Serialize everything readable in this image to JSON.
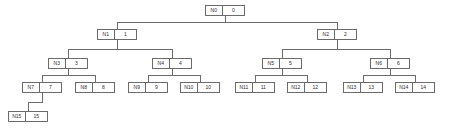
{
  "diagram": {
    "type": "binary-tree",
    "colors": {
      "border": "#6b6b6b",
      "edge": "#6b6b6b",
      "background": "#ffffff",
      "text": "#2b2b2b"
    },
    "nodes": [
      {
        "id": "N0",
        "name": "N0",
        "value": "0",
        "x": 205,
        "y": 5,
        "level": 0
      },
      {
        "id": "N1",
        "name": "N1",
        "value": "1",
        "x": 97,
        "y": 29,
        "level": 1
      },
      {
        "id": "N2",
        "name": "N2",
        "value": "2",
        "x": 317,
        "y": 29,
        "level": 1
      },
      {
        "id": "N3",
        "name": "N3",
        "value": "3",
        "x": 48,
        "y": 58,
        "level": 2
      },
      {
        "id": "N4",
        "name": "N4",
        "value": "4",
        "x": 152,
        "y": 58,
        "level": 2
      },
      {
        "id": "N5",
        "name": "N5",
        "value": "5",
        "x": 262,
        "y": 58,
        "level": 2
      },
      {
        "id": "N6",
        "name": "N6",
        "value": "6",
        "x": 370,
        "y": 58,
        "level": 2
      },
      {
        "id": "N7",
        "name": "N7",
        "value": "7",
        "x": 22,
        "y": 82,
        "level": 3
      },
      {
        "id": "N8",
        "name": "N8",
        "value": "8",
        "x": 75,
        "y": 82,
        "level": 3
      },
      {
        "id": "N9",
        "name": "N9",
        "value": "9",
        "x": 128,
        "y": 82,
        "level": 3
      },
      {
        "id": "N10",
        "name": "N10",
        "value": "10",
        "x": 180,
        "y": 82,
        "level": 3
      },
      {
        "id": "N11",
        "name": "N11",
        "value": "11",
        "x": 235,
        "y": 82,
        "level": 3
      },
      {
        "id": "N12",
        "name": "N12",
        "value": "12",
        "x": 287,
        "y": 82,
        "level": 3
      },
      {
        "id": "N13",
        "name": "N13",
        "value": "13",
        "x": 343,
        "y": 82,
        "level": 3
      },
      {
        "id": "N14",
        "name": "N14",
        "value": "14",
        "x": 395,
        "y": 82,
        "level": 3
      },
      {
        "id": "N15",
        "name": "N15",
        "value": "15",
        "x": 8,
        "y": 111,
        "level": 4
      }
    ],
    "edges": [
      {
        "from": "N0",
        "to": "N1",
        "style": "orthogonal"
      },
      {
        "from": "N0",
        "to": "N2",
        "style": "orthogonal"
      },
      {
        "from": "N1",
        "to": "N3",
        "style": "orthogonal"
      },
      {
        "from": "N1",
        "to": "N4",
        "style": "orthogonal"
      },
      {
        "from": "N2",
        "to": "N5",
        "style": "orthogonal"
      },
      {
        "from": "N2",
        "to": "N6",
        "style": "orthogonal"
      },
      {
        "from": "N3",
        "to": "N7",
        "style": "orthogonal"
      },
      {
        "from": "N3",
        "to": "N8",
        "style": "orthogonal"
      },
      {
        "from": "N4",
        "to": "N9",
        "style": "orthogonal"
      },
      {
        "from": "N4",
        "to": "N10",
        "style": "orthogonal"
      },
      {
        "from": "N5",
        "to": "N11",
        "style": "orthogonal"
      },
      {
        "from": "N5",
        "to": "N12",
        "style": "orthogonal"
      },
      {
        "from": "N6",
        "to": "N13",
        "style": "orthogonal"
      },
      {
        "from": "N6",
        "to": "N14",
        "style": "orthogonal"
      },
      {
        "from": "N7",
        "to": "N15",
        "style": "orthogonal"
      }
    ],
    "geometry": {
      "node_width": 40,
      "node_height": 11,
      "name_cell_width": 17,
      "value_cell_width": 22
    }
  }
}
